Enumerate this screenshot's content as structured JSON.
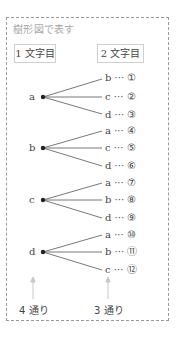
{
  "title": "樹形図で表す",
  "headers": {
    "first": "1 文字目",
    "second": "2 文字目"
  },
  "roots": [
    {
      "label": "a",
      "leaves": [
        {
          "letter": "b",
          "num": "①"
        },
        {
          "letter": "c",
          "num": "②"
        },
        {
          "letter": "d",
          "num": "③"
        }
      ]
    },
    {
      "label": "b",
      "leaves": [
        {
          "letter": "a",
          "num": "④"
        },
        {
          "letter": "c",
          "num": "⑤"
        },
        {
          "letter": "d",
          "num": "⑥"
        }
      ]
    },
    {
      "label": "c",
      "leaves": [
        {
          "letter": "a",
          "num": "⑦"
        },
        {
          "letter": "b",
          "num": "⑧"
        },
        {
          "letter": "d",
          "num": "⑨"
        }
      ]
    },
    {
      "label": "d",
      "leaves": [
        {
          "letter": "a",
          "num": "⑩"
        },
        {
          "letter": "b",
          "num": "⑪"
        },
        {
          "letter": "c",
          "num": "⑫"
        }
      ]
    }
  ],
  "dots": "···",
  "footer": {
    "first_count": "4 通り",
    "second_count": "3 通り"
  },
  "colors": {
    "line": "#555555",
    "arrow": "#c8c8c8",
    "border": "#9a9a9a"
  }
}
